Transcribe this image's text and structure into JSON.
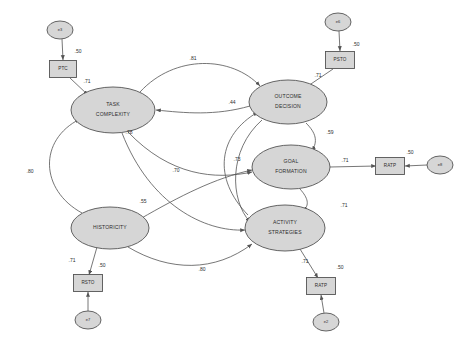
{
  "diagram": {
    "type": "structural-equation-model-path-diagram",
    "nodes": [
      {
        "id": "e3",
        "label": "e3",
        "shape": "ellipse",
        "cx": 60,
        "cy": 30,
        "rx": 13,
        "ry": 9,
        "size": "tiny"
      },
      {
        "id": "e6",
        "label": "e6",
        "shape": "ellipse",
        "cx": 338,
        "cy": 22,
        "rx": 13,
        "ry": 9,
        "size": "tiny"
      },
      {
        "id": "e8",
        "label": "e8",
        "shape": "ellipse",
        "cx": 440,
        "cy": 165,
        "rx": 13,
        "ry": 9,
        "size": "tiny"
      },
      {
        "id": "e7",
        "label": "e7",
        "shape": "ellipse",
        "cx": 88,
        "cy": 320,
        "rx": 13,
        "ry": 9,
        "size": "tiny"
      },
      {
        "id": "e2",
        "label": "e2",
        "shape": "ellipse",
        "cx": 326,
        "cy": 322,
        "rx": 13,
        "ry": 9,
        "size": "tiny"
      },
      {
        "id": "PTC",
        "label": "PTC",
        "shape": "rect",
        "cx": 63,
        "cy": 69,
        "w": 27,
        "h": 17,
        "size": "small"
      },
      {
        "id": "PSTO",
        "label": "PSTO",
        "shape": "rect",
        "cx": 340,
        "cy": 60,
        "w": 29,
        "h": 17,
        "size": "small"
      },
      {
        "id": "RATP8",
        "label": "RATP",
        "shape": "rect",
        "cx": 390,
        "cy": 166,
        "w": 29,
        "h": 17,
        "size": "small"
      },
      {
        "id": "RSTO",
        "label": "RSTO",
        "shape": "rect",
        "cx": 88,
        "cy": 283,
        "w": 29,
        "h": 17,
        "size": "small"
      },
      {
        "id": "RATP2",
        "label": "RATP",
        "shape": "rect",
        "cx": 321,
        "cy": 286,
        "w": 29,
        "h": 17,
        "size": "small"
      },
      {
        "id": "TASK_COMPLEXITY",
        "label_line1": "TASK",
        "label_line2": "COMPLEXITY",
        "shape": "ellipse",
        "cx": 113,
        "cy": 110,
        "rx": 42,
        "ry": 23,
        "size": "big"
      },
      {
        "id": "OUTCOME_DECISION",
        "label_line1": "OUTCOME",
        "label_line2": "DECISION",
        "shape": "ellipse",
        "cx": 288,
        "cy": 102,
        "rx": 39,
        "ry": 22,
        "size": "big"
      },
      {
        "id": "GOAL_FORMATION",
        "label_line1": "GOAL",
        "label_line2": "FORMATION",
        "shape": "ellipse",
        "cx": 291,
        "cy": 167,
        "rx": 39,
        "ry": 22,
        "size": "big"
      },
      {
        "id": "HISTORICITY",
        "label_line1": "HISTORICITY",
        "label_line2": "",
        "shape": "ellipse",
        "cx": 110,
        "cy": 228,
        "rx": 39,
        "ry": 21,
        "size": "big"
      },
      {
        "id": "ACTIVITY_STRATEGIES",
        "label_line1": "ACTIVITY",
        "label_line2": "STRATEGIES",
        "shape": "ellipse",
        "cx": 285,
        "cy": 228,
        "rx": 40,
        "ry": 23,
        "size": "big"
      }
    ],
    "edge_weights": [
      {
        "id": "w_e3_ptc",
        "value": ".50",
        "x": 78,
        "y": 52
      },
      {
        "id": "w_ptc_task",
        "value": ".71",
        "x": 87,
        "y": 82
      },
      {
        "id": "w_e6_psto",
        "value": ".50",
        "x": 356,
        "y": 45
      },
      {
        "id": "w_psto_outcome",
        "value": ".71",
        "x": 318,
        "y": 76
      },
      {
        "id": "w_task_outcome",
        "value": ".81",
        "x": 193,
        "y": 59
      },
      {
        "id": "w_outcome_44",
        "value": ".44",
        "x": 232,
        "y": 103
      },
      {
        "id": "w_goal_59",
        "value": ".59",
        "x": 330,
        "y": 133
      },
      {
        "id": "w_goal_ratp",
        "value": ".71",
        "x": 345,
        "y": 161
      },
      {
        "id": "w_e8_ratp",
        "value": ".50",
        "x": 410,
        "y": 153
      },
      {
        "id": "w_task_78",
        "value": ".78",
        "x": 129,
        "y": 133
      },
      {
        "id": "w_73",
        "value": ".73",
        "x": 237,
        "y": 160
      },
      {
        "id": "w_70",
        "value": ".70",
        "x": 176,
        "y": 171
      },
      {
        "id": "w_hist_55",
        "value": ".55",
        "x": 143,
        "y": 202
      },
      {
        "id": "w_80_left",
        "value": ".80",
        "x": 30,
        "y": 172
      },
      {
        "id": "w_act_71",
        "value": ".71",
        "x": 344,
        "y": 206
      },
      {
        "id": "w_80_bottom",
        "value": ".80",
        "x": 202,
        "y": 270
      },
      {
        "id": "w_hist_rsto",
        "value": ".71",
        "x": 72,
        "y": 261
      },
      {
        "id": "w_rsto_e7",
        "value": ".50",
        "x": 102,
        "y": 266
      },
      {
        "id": "w_act_ratp",
        "value": ".71",
        "x": 305,
        "y": 262
      },
      {
        "id": "w_ratp_e2",
        "value": ".50",
        "x": 340,
        "y": 268
      }
    ]
  }
}
